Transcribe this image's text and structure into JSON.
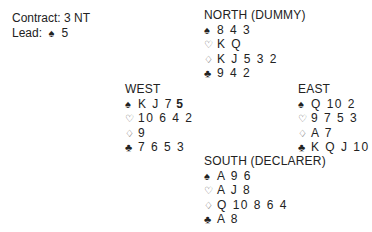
{
  "info": {
    "contract_label": "Contract: 3 NT",
    "lead_label": "Lead:",
    "lead_suit_icon": "spade-icon",
    "lead_card": "5"
  },
  "suit_icons": {
    "spades": "♠",
    "hearts": "♡",
    "diamonds": "♢",
    "clubs": "♣"
  },
  "hands": {
    "north": {
      "title": "NORTH (DUMMY)",
      "spades": "8 4 3",
      "hearts": "K Q",
      "diamonds": "K J 5 3 2",
      "clubs": "9 4 2"
    },
    "west": {
      "title": "WEST",
      "spades": "K J 7",
      "spades_highlight": "5",
      "hearts": "10 6 4 2",
      "diamonds": "9",
      "clubs": "7 6 5 3"
    },
    "east": {
      "title": "EAST",
      "spades": "Q 10 2",
      "hearts": "9 7 5 3",
      "diamonds": "A 7",
      "clubs": "K Q J 10"
    },
    "south": {
      "title": "SOUTH (DECLARER)",
      "spades": "A 9 6",
      "hearts": "A J 8",
      "diamonds": "Q 10 8 6 4",
      "clubs": "A 8"
    }
  }
}
